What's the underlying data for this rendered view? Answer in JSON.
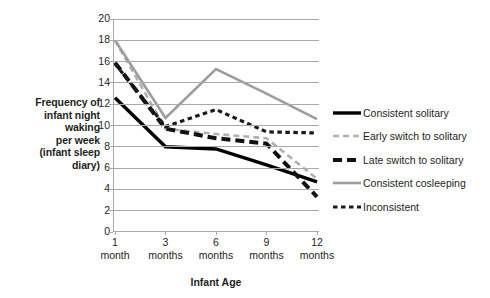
{
  "chart_data": {
    "type": "line",
    "title": "",
    "xlabel": "Infant Age",
    "ylabel": "Frequency of infant night waking per week (infant sleep diary)",
    "ylabel_lines": [
      "Frequency of",
      "infant night",
      "waking",
      "per week",
      "(infant sleep",
      "diary)"
    ],
    "categories": [
      "1 month",
      "3 months",
      "6 months",
      "9 months",
      "12 months"
    ],
    "category_lines": [
      [
        "1",
        "month"
      ],
      [
        "3",
        "months"
      ],
      [
        "6",
        "months"
      ],
      [
        "9",
        "months"
      ],
      [
        "12",
        "months"
      ]
    ],
    "x": [
      1,
      3,
      6,
      9,
      12
    ],
    "ylim": [
      0,
      20
    ],
    "ytick_step": 2,
    "yticks": [
      0,
      2,
      4,
      6,
      8,
      10,
      12,
      14,
      16,
      18,
      20
    ],
    "grid": true,
    "grid_axis": "y",
    "legend_position": "right",
    "series": [
      {
        "name": "Consistent solitary",
        "values": [
          12.6,
          8.0,
          7.8,
          6.3,
          4.7
        ],
        "color": "#000000",
        "style": "solid",
        "width": 3.4,
        "dash": ""
      },
      {
        "name": "Early switch to solitary",
        "values": [
          18.0,
          9.7,
          9.2,
          8.8,
          5.0
        ],
        "color": "#b0b0b0",
        "style": "dashed",
        "width": 2.6,
        "dash": "6,4"
      },
      {
        "name": "Late switch to solitary",
        "values": [
          15.9,
          9.7,
          8.8,
          8.3,
          3.3
        ],
        "color": "#111111",
        "style": "dashed-bold",
        "width": 4.0,
        "dash": "9,5"
      },
      {
        "name": "Consistent cosleeping",
        "values": [
          18.0,
          10.7,
          15.3,
          13.0,
          10.6
        ],
        "color": "#9d9d9d",
        "style": "solid",
        "width": 2.6,
        "dash": ""
      },
      {
        "name": "Inconsistent",
        "values": [
          15.8,
          9.9,
          11.5,
          9.4,
          9.3
        ],
        "color": "#1a1a1a",
        "style": "dotted",
        "width": 3.2,
        "dash": "4.5,3.5"
      }
    ],
    "colors": {
      "axis": "#a7a9ac",
      "grid": "#a7a9ac",
      "text": "#231f20",
      "background": "#ffffff"
    }
  }
}
